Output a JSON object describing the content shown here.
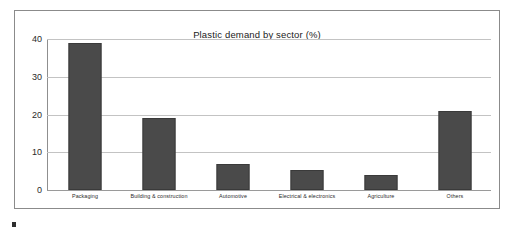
{
  "figure": {
    "title": "Plastic demand by sector (%)",
    "frame_color": "#8b8b8b",
    "background": "#ffffff",
    "bar_color": "#4a4a4a",
    "gridline_color": "#c3c3c3",
    "axis_color": "#8f8f8f"
  },
  "chart_data": {
    "type": "bar",
    "title": "Plastic demand by sector (%)",
    "xlabel": "",
    "ylabel": "",
    "ylim": [
      0,
      40
    ],
    "yticks": [
      0,
      10,
      20,
      30,
      40
    ],
    "grid": true,
    "legend": false,
    "categories": [
      "Packaging",
      "Building & construction",
      "Automotive",
      "Electrical & electronics",
      "Agriculture",
      "Others"
    ],
    "values": [
      39,
      19,
      7,
      5.4,
      4,
      21
    ]
  }
}
